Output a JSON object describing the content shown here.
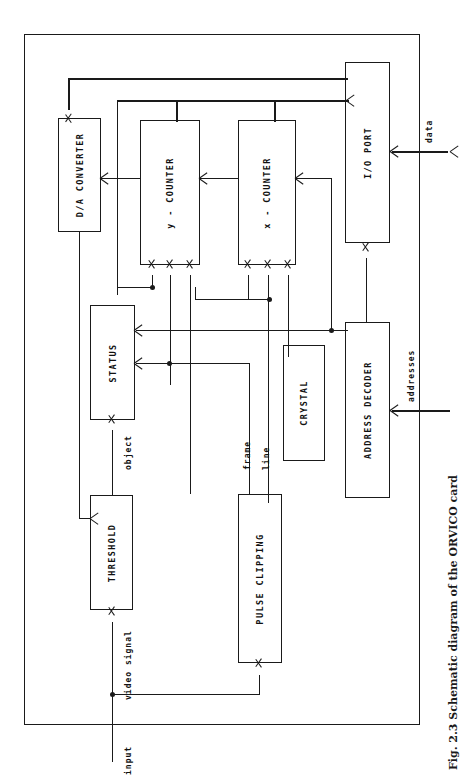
{
  "figure": {
    "caption": "Fig. 2.3 Schematic diagram of the ORVICO card",
    "orientation": "rotated-90-ccw",
    "line_color": "#1a1a1a",
    "background": "#ffffff"
  },
  "blocks": [
    {
      "id": "da-converter",
      "label": "D/A CONVERTER"
    },
    {
      "id": "y-counter",
      "label": "y - COUNTER"
    },
    {
      "id": "x-counter",
      "label": "x - COUNTER"
    },
    {
      "id": "io-port",
      "label": "I/O PORT"
    },
    {
      "id": "status",
      "label": "STATUS"
    },
    {
      "id": "crystal",
      "label": "CRYSTAL"
    },
    {
      "id": "address-decoder",
      "label": "ADDRESS DECODER"
    },
    {
      "id": "threshold",
      "label": "THRESHOLD"
    },
    {
      "id": "pulse-clipping",
      "label": "PULSE CLIPPING"
    }
  ],
  "signals": {
    "data": "data",
    "addresses": "addresses",
    "object": "object",
    "frame": "frame",
    "line": "line",
    "video_signal": "video signal",
    "input": "input"
  }
}
